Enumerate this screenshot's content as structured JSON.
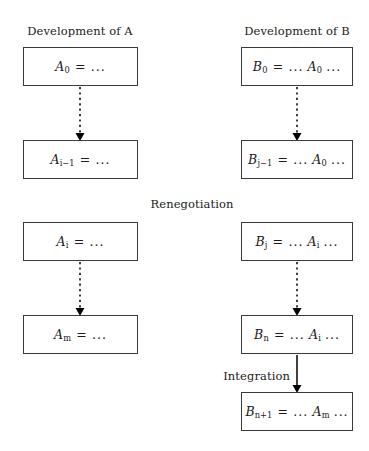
{
  "diagram": {
    "title_a": "Development of A",
    "title_b": "Development of B",
    "stage_renegotiation": "Renegotiation",
    "stage_integration": "Integration",
    "colors": {
      "background": "#ffffff",
      "box_border": "#3a3a3a",
      "text": "#1a1a1a",
      "edge": "#000000"
    },
    "nodes": [
      {
        "id": "a0",
        "column": "A",
        "row": 1,
        "label": "A_0 = ...",
        "symbol": "A",
        "subscript": "0",
        "operator": "=",
        "rhs": "...",
        "x": 23,
        "y": 47,
        "w": 115,
        "h": 39
      },
      {
        "id": "b0",
        "column": "B",
        "row": 1,
        "label": "B_0 = ... A_0 ...",
        "symbol": "B",
        "subscript": "0",
        "operator": "=",
        "rhs": "... A_0 ...",
        "x": 241,
        "y": 47,
        "w": 112,
        "h": 39
      },
      {
        "id": "ai1",
        "column": "A",
        "row": 2,
        "label": "A_{i-1} = ...",
        "symbol": "A",
        "subscript": "i−1",
        "operator": "=",
        "rhs": "...",
        "x": 23,
        "y": 140,
        "w": 115,
        "h": 39
      },
      {
        "id": "bj1",
        "column": "B",
        "row": 2,
        "label": "B_{j-1} = ... A_0 ...",
        "symbol": "B",
        "subscript": "j−1",
        "operator": "=",
        "rhs": "... A_0 ...",
        "x": 241,
        "y": 140,
        "w": 112,
        "h": 39
      },
      {
        "id": "ai",
        "column": "A",
        "row": 3,
        "label": "A_i = ...",
        "symbol": "A",
        "subscript": "i",
        "operator": "=",
        "rhs": "...",
        "x": 23,
        "y": 222,
        "w": 115,
        "h": 39
      },
      {
        "id": "bj",
        "column": "B",
        "row": 3,
        "label": "B_j = ... A_i ...",
        "symbol": "B",
        "subscript": "j",
        "operator": "=",
        "rhs": "... A_i ...",
        "x": 241,
        "y": 222,
        "w": 112,
        "h": 39
      },
      {
        "id": "am",
        "column": "A",
        "row": 4,
        "label": "A_m = ...",
        "symbol": "A",
        "subscript": "m",
        "operator": "=",
        "rhs": "...",
        "x": 23,
        "y": 315,
        "w": 115,
        "h": 39
      },
      {
        "id": "bn",
        "column": "B",
        "row": 4,
        "label": "B_n = ... A_i ...",
        "symbol": "B",
        "subscript": "n",
        "operator": "=",
        "rhs": "... A_i ...",
        "x": 241,
        "y": 315,
        "w": 112,
        "h": 39
      },
      {
        "id": "bn1",
        "column": "B",
        "row": 5,
        "label": "B_{n+1} = ... A_m ...",
        "symbol": "B",
        "subscript": "n+1",
        "operator": "=",
        "rhs": "... A_m ...",
        "x": 241,
        "y": 392,
        "w": 112,
        "h": 39
      }
    ],
    "edges": [
      {
        "id": "a0-ai1",
        "from": "a0",
        "to": "ai1",
        "style": "dashed",
        "x": 80,
        "y1": 86,
        "y2": 140
      },
      {
        "id": "b0-bj1",
        "from": "b0",
        "to": "bj1",
        "style": "dashed",
        "x": 297,
        "y1": 86,
        "y2": 140
      },
      {
        "id": "ai-am",
        "from": "ai",
        "to": "am",
        "style": "dashed",
        "x": 80,
        "y1": 261,
        "y2": 315
      },
      {
        "id": "bj-bn",
        "from": "bj",
        "to": "bn",
        "style": "dashed",
        "x": 297,
        "y1": 261,
        "y2": 315
      },
      {
        "id": "bn-bn1",
        "from": "bn",
        "to": "bn1",
        "style": "solid",
        "x": 297,
        "y1": 354,
        "y2": 392
      }
    ],
    "labels": [
      {
        "id": "title-a",
        "text_key": "title_a",
        "x": 80,
        "y": 33
      },
      {
        "id": "title-b",
        "text_key": "title_b",
        "x": 297,
        "y": 33
      },
      {
        "id": "renegotiation",
        "text_key": "stage_renegotiation",
        "x": 192,
        "y": 206
      },
      {
        "id": "integration",
        "text_key": "stage_integration",
        "x": 248,
        "y": 378
      }
    ]
  }
}
